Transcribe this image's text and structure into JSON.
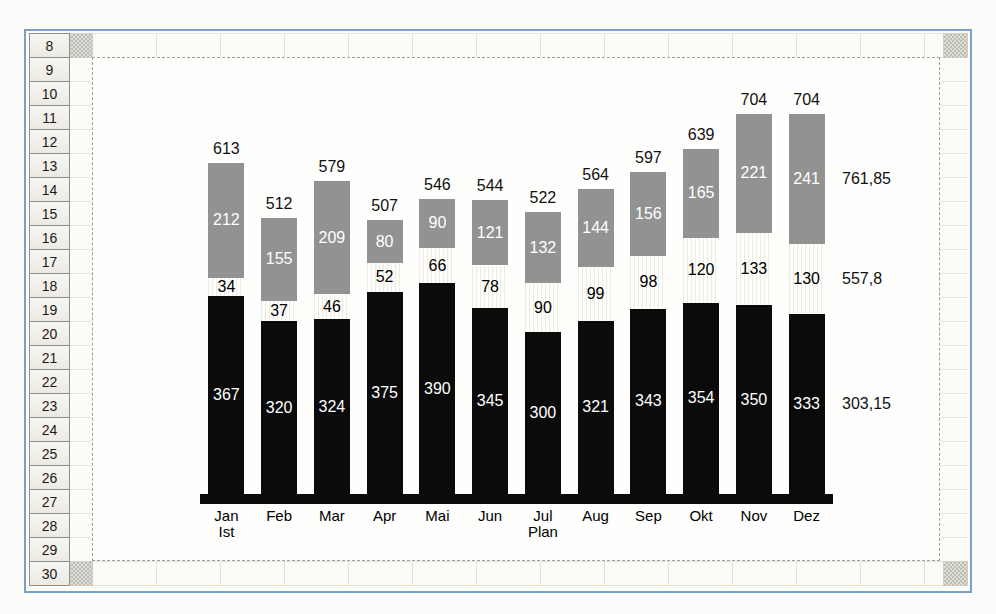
{
  "spreadsheet": {
    "row_numbers": [
      "8",
      "9",
      "10",
      "11",
      "12",
      "13",
      "14",
      "15",
      "16",
      "17",
      "18",
      "19",
      "20",
      "21",
      "22",
      "23",
      "24",
      "25",
      "26",
      "27",
      "28",
      "29",
      "30"
    ]
  },
  "chart_data": {
    "type": "bar",
    "stacked": true,
    "title": "",
    "xlabel": "",
    "ylabel": "",
    "legend": "none",
    "grid": false,
    "categories": [
      "Jan",
      "Feb",
      "Mar",
      "Apr",
      "Mai",
      "Jun",
      "Jul",
      "Aug",
      "Sep",
      "Okt",
      "Nov",
      "Dez"
    ],
    "category_sublabels": [
      "Ist",
      "",
      "",
      "",
      "",
      "",
      "Plan",
      "",
      "",
      "",
      "",
      ""
    ],
    "series": [
      {
        "name": "bottom-black-segment",
        "color": "#0b0b0b",
        "label_color": "#ffffff",
        "right_label": "303,15",
        "values": [
          367,
          320,
          324,
          375,
          390,
          345,
          300,
          321,
          343,
          354,
          350,
          333
        ]
      },
      {
        "name": "middle-white-segment",
        "color": "#fdfdfa",
        "label_color": "#000000",
        "right_label": "557,8",
        "values": [
          34,
          37,
          46,
          52,
          66,
          78,
          90,
          99,
          98,
          120,
          133,
          130
        ]
      },
      {
        "name": "top-gray-segment",
        "color": "#929292",
        "label_color": "#ffffff",
        "right_label": "761,85",
        "values": [
          212,
          155,
          209,
          80,
          90,
          121,
          132,
          144,
          156,
          165,
          221,
          241
        ]
      }
    ],
    "totals": [
      "613",
      "512",
      "579",
      "507",
      "546",
      "544",
      "522",
      "564",
      "597",
      "639",
      "704",
      "704"
    ]
  },
  "colors": {
    "frame_border": "#7aa0c6",
    "bar_black": "#0b0b0b",
    "bar_gray": "#929292",
    "bar_light": "#fdfdfa",
    "axis_line": "#0b0b0b"
  }
}
